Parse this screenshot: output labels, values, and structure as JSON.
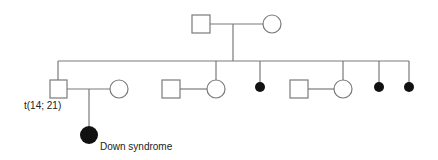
{
  "diagram": {
    "type": "pedigree",
    "colors": {
      "line": "#7a7a7a",
      "affected": "#111111",
      "background": "#ffffff"
    },
    "generation_1": [
      {
        "id": "g1-father",
        "sex": "male",
        "affected": false
      },
      {
        "id": "g1-mother",
        "sex": "female",
        "affected": false
      }
    ],
    "generation_2": [
      {
        "id": "g2-son-carrier",
        "sex": "male",
        "affected": false,
        "label": "t(14; 21)",
        "spouse": "female-unaffected"
      },
      {
        "id": "g2-daughter-1",
        "sex": "female",
        "affected": false,
        "spouse": "male-unaffected"
      },
      {
        "id": "g2-miscarriage-1",
        "sex": "unknown",
        "affected": true,
        "symbol": "small-filled-circle"
      },
      {
        "id": "g2-daughter-2",
        "sex": "female",
        "affected": false,
        "spouse": "male-unaffected"
      },
      {
        "id": "g2-miscarriage-2",
        "sex": "unknown",
        "affected": true,
        "symbol": "small-filled-circle"
      },
      {
        "id": "g2-miscarriage-3",
        "sex": "unknown",
        "affected": true,
        "symbol": "small-filled-circle"
      }
    ],
    "generation_3": [
      {
        "id": "g3-daughter",
        "sex": "female",
        "affected": true,
        "label": "Down syndrome"
      }
    ],
    "labels": {
      "translocation": "t(14; 21)",
      "affected_child": "Down syndrome"
    }
  }
}
